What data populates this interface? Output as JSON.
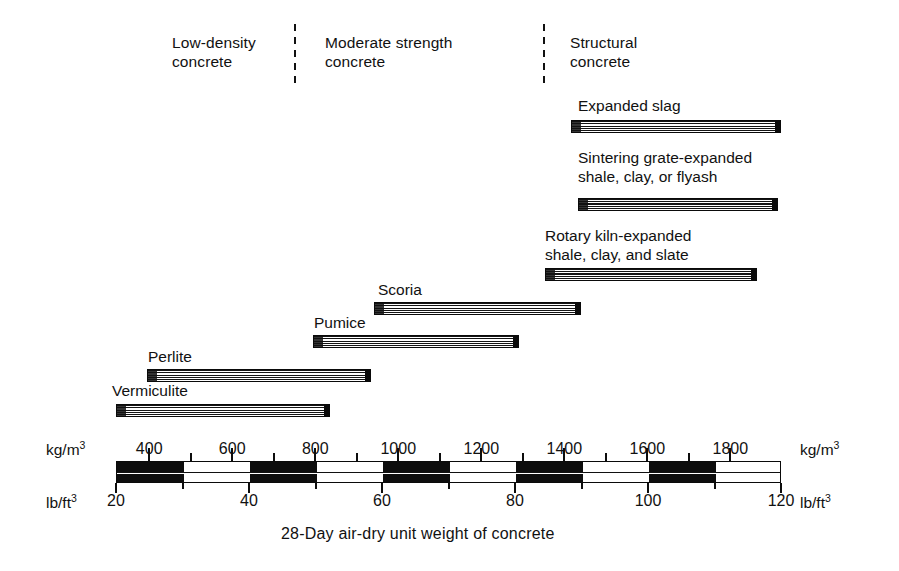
{
  "figure": {
    "caption": "28-Day air-dry unit weight of concrete"
  },
  "categories": [
    {
      "id": "low-density",
      "label": "Low-density\nconcrete",
      "x": 172,
      "y": 33
    },
    {
      "id": "moderate-strength",
      "label": "Moderate strength\nconcrete",
      "x": 325,
      "y": 33
    },
    {
      "id": "structural",
      "label": "Structural\nconcrete",
      "x": 570,
      "y": 33
    }
  ],
  "dividers": [
    {
      "id": "divider-1",
      "x": 294,
      "y": 24,
      "height": 62
    },
    {
      "id": "divider-2",
      "x": 543,
      "y": 24,
      "height": 62
    }
  ],
  "axis": {
    "primary_unit": "kg/m",
    "primary_unit_sup": "3",
    "secondary_unit": "lb/ft",
    "secondary_unit_sup": "3",
    "top_ticks": [
      "400",
      "600",
      "800",
      "1000",
      "1200",
      "1400",
      "1600",
      "1800"
    ],
    "bottom_ticks": [
      "20",
      "40",
      "60",
      "80",
      "100",
      "120"
    ],
    "lb_min": 20,
    "lb_max": 120,
    "kg_min": 320,
    "kg_max": 1922,
    "pixel_left": 116,
    "pixel_right": 781
  },
  "chart_data": {
    "type": "bar",
    "orientation": "horizontal-range",
    "title": "",
    "xlabel": "28-Day air-dry unit weight of concrete",
    "ylabel": "",
    "x_units_primary": "kg/m3",
    "x_units_secondary": "lb/ft3",
    "xlim_primary": [
      320,
      1922
    ],
    "xlim_secondary": [
      20,
      120
    ],
    "grid": false,
    "legend": "none",
    "x_tick_labels_primary": [
      400,
      600,
      800,
      1000,
      1200,
      1400,
      1600,
      1800
    ],
    "x_tick_labels_secondary": [
      20,
      40,
      60,
      80,
      100,
      120
    ],
    "categories": [
      "Expanded slag",
      "Sintering grate-expanded shale, clay, or flyash",
      "Rotary kiln-expanded shale, clay, and slate",
      "Scoria",
      "Pumice",
      "Perlite",
      "Vermiculite"
    ],
    "ranges_kg_per_m3": [
      {
        "name": "Expanded slag",
        "start": 1415,
        "end": 1920,
        "group": "structural"
      },
      {
        "name": "Sintering grate-expanded shale, clay, or flyash",
        "start": 1432,
        "end": 1915,
        "group": "structural"
      },
      {
        "name": "Rotary kiln-expanded shale, clay, and slate",
        "start": 1353,
        "end": 1864,
        "group": "structural"
      },
      {
        "name": "Scoria",
        "start": 942,
        "end": 1441,
        "group": "moderate-strength"
      },
      {
        "name": "Pumice",
        "start": 795,
        "end": 1292,
        "group": "moderate-strength"
      },
      {
        "name": "Perlite",
        "start": 395,
        "end": 935,
        "group": "low-density"
      },
      {
        "name": "Vermiculite",
        "start": 320,
        "end": 836,
        "group": "low-density"
      }
    ],
    "ranges_lb_per_ft3": [
      {
        "name": "Expanded slag",
        "start": 88.3,
        "end": 119.9
      },
      {
        "name": "Sintering grate-expanded shale, clay, or flyash",
        "start": 89.4,
        "end": 119.5
      },
      {
        "name": "Rotary kiln-expanded shale, clay, and slate",
        "start": 84.5,
        "end": 116.4
      },
      {
        "name": "Scoria",
        "start": 58.8,
        "end": 89.9
      },
      {
        "name": "Pumice",
        "start": 49.6,
        "end": 80.6
      },
      {
        "name": "Perlite",
        "start": 24.7,
        "end": 58.4
      },
      {
        "name": "Vermiculite",
        "start": 20.0,
        "end": 52.2
      }
    ]
  },
  "bars": [
    {
      "id": "expanded-slag",
      "label": "Expanded slag",
      "label_x": 578,
      "label_y": 96,
      "x": 571,
      "y": 120,
      "w": 210,
      "h": 13
    },
    {
      "id": "sintering-grate-expanded-shale-clay-flyash",
      "label": "Sintering grate-expanded\nshale, clay, or flyash",
      "label_x": 578,
      "label_y": 148,
      "x": 578,
      "y": 198,
      "w": 200,
      "h": 13
    },
    {
      "id": "rotary-kiln-expanded-shale-clay-slate",
      "label": "Rotary kiln-expanded\nshale, clay, and slate",
      "label_x": 545,
      "label_y": 226,
      "x": 545,
      "y": 268,
      "w": 212,
      "h": 13
    },
    {
      "id": "scoria",
      "label": "Scoria",
      "label_x": 378,
      "label_y": 280,
      "x": 374,
      "y": 302,
      "w": 207,
      "h": 13
    },
    {
      "id": "pumice",
      "label": "Pumice",
      "label_x": 314,
      "label_y": 313,
      "x": 313,
      "y": 335,
      "w": 206,
      "h": 13
    },
    {
      "id": "perlite",
      "label": "Perlite",
      "label_x": 148,
      "label_y": 347,
      "x": 147,
      "y": 369,
      "w": 224,
      "h": 13
    },
    {
      "id": "vermiculite",
      "label": "Vermiculite",
      "label_x": 112,
      "label_y": 381,
      "x": 116,
      "y": 404,
      "w": 214,
      "h": 13
    }
  ]
}
